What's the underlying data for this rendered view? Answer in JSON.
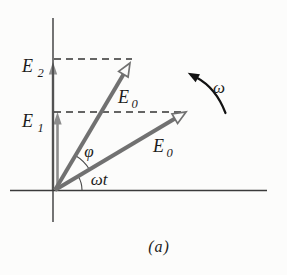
{
  "figure": {
    "caption": "(a)",
    "labels": {
      "e2": {
        "base": "E",
        "sub": "2"
      },
      "e1": {
        "base": "E",
        "sub": "1"
      },
      "e0_upper": {
        "base": "E",
        "sub": "0"
      },
      "e0_lower": {
        "base": "E",
        "sub": "0"
      },
      "phi": "φ",
      "omega_t": "ωt",
      "omega": "ω"
    },
    "colors": {
      "background": "#fcfcfb",
      "axis": "#3a3a3a",
      "vector": "#717171",
      "projection_arrow": "#8d8d8d",
      "dashed_line": "#333333",
      "angle_arc": "#4a4a4a",
      "rotation_arrow": "#121212",
      "text": "#1c1c1c"
    }
  }
}
